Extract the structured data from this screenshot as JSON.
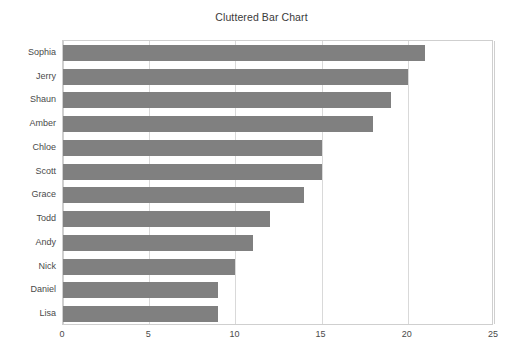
{
  "chart_data": {
    "type": "bar",
    "orientation": "horizontal",
    "title": "Cluttered Bar Chart",
    "xlabel": "",
    "ylabel": "",
    "categories": [
      "Sophia",
      "Jerry",
      "Shaun",
      "Amber",
      "Chloe",
      "Scott",
      "Grace",
      "Todd",
      "Andy",
      "Nick",
      "Daniel",
      "Lisa"
    ],
    "values": [
      21,
      20,
      19,
      18,
      15,
      15,
      14,
      12,
      11,
      10,
      9,
      9
    ],
    "xlim": [
      0,
      25
    ],
    "x_ticks": [
      0,
      5,
      10,
      15,
      20,
      25
    ],
    "x_tick_labels": [
      "0",
      "5",
      "10",
      "15",
      "20",
      "25"
    ],
    "y_tick_labels": [
      "Sophia",
      "Jerry",
      "Shaun",
      "Amber",
      "Chloe",
      "Scott",
      "Grace",
      "Todd",
      "Andy",
      "Nick",
      "Daniel",
      "Lisa"
    ],
    "grid": "vertical",
    "legend": null,
    "bar_color": "#808080",
    "gridline_color": "#d9d9d9",
    "frame_color": "#cfcfcf",
    "text_color": "#4a4a4a",
    "title_color": "#3a3a3a",
    "background_color": "#ffffff"
  }
}
